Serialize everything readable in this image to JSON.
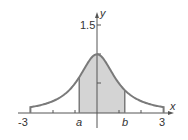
{
  "figure": {
    "function": "y = 1/(1+x^2)",
    "x_axis_label": "x",
    "y_axis_label": "y",
    "x_ticks": [
      "-3",
      "3"
    ],
    "x_markers": [
      "a",
      "b"
    ],
    "y_tick_labels": [
      "1.5"
    ],
    "shaded_region": {
      "from": "a",
      "to": "b"
    },
    "colors": {
      "curve": "#7a7a7a",
      "fill": "#d4d4d4",
      "axis": "#555555"
    }
  },
  "chart_data": {
    "type": "area",
    "title": "",
    "xlabel": "x",
    "ylabel": "y",
    "xlim": [
      -3,
      3
    ],
    "ylim": [
      0,
      1.5
    ],
    "x_tick_labels": [
      "-3",
      "a",
      "b",
      "3"
    ],
    "y_tick_labels": [
      "1.5"
    ],
    "series": [
      {
        "name": "curve",
        "x": [
          -3,
          -2.5,
          -2,
          -1.5,
          -1,
          -0.5,
          0,
          0.5,
          1,
          1.5,
          2,
          2.5,
          3
        ],
        "y": [
          0.1,
          0.138,
          0.2,
          0.308,
          0.5,
          0.8,
          1.0,
          0.8,
          0.5,
          0.308,
          0.2,
          0.138,
          0.1
        ]
      }
    ],
    "shaded_interval": {
      "a": -0.8,
      "b": 1.25
    },
    "grid": false
  }
}
